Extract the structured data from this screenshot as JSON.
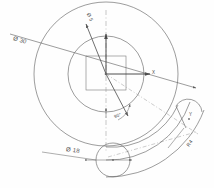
{
  "drawing": {
    "title": "Engineering part drawing",
    "type": "technical-cad-sketch",
    "background_color": "#fefefe",
    "line_color": "#5a5a5a",
    "construction_color": "#8a8a8a",
    "labels": {
      "outer_diameter": "Ø 30",
      "bolt_circle_diameter": "Ø 5",
      "slot_end_diameter": "Ø 18",
      "angle": "90°",
      "radius": "R4",
      "axis_x": "X",
      "axis_y": "Y"
    }
  },
  "geometry": {
    "center": {
      "x": 106,
      "y": 74
    },
    "circles": [
      {
        "name": "outer-circle",
        "r": 72
      },
      {
        "name": "inner-circle",
        "r": 38
      }
    ],
    "square": {
      "name": "center-square",
      "x": 86,
      "y": 56,
      "w": 40,
      "h": 34
    },
    "slot_end_circle": {
      "name": "slot-end-circle",
      "cx": 113,
      "cy": 160,
      "r": 17
    }
  }
}
